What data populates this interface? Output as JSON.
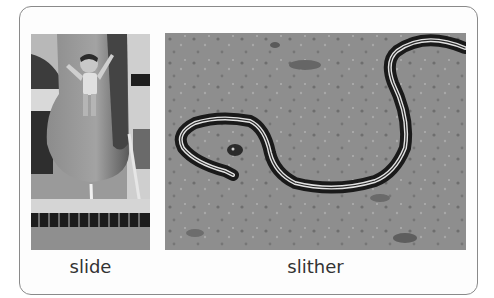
{
  "figure": {
    "panels": [
      {
        "id": "slide",
        "label": "slide",
        "image_description": "Black-and-white photo of a young child with arms raised going down a curved water slide into a pool"
      },
      {
        "id": "slither",
        "label": "slither",
        "image_description": "Black-and-white photo of a striped garter snake slithering across dirt ground"
      }
    ]
  },
  "colors": {
    "border": "#8a8a8a",
    "caption_text": "#333333",
    "background": "#ffffff"
  }
}
